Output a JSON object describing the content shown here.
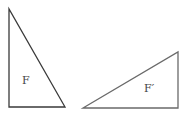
{
  "diagram": {
    "stroke_color": "#3a3a3a",
    "figures": [
      {
        "id": "F",
        "label": "F",
        "points": "9,9 9,107 65,107",
        "label_x": 22,
        "label_y": 84
      },
      {
        "id": "F-prime",
        "label": "F′",
        "points": "83,108 178,52 178,108",
        "label_x": 144,
        "label_y": 92
      }
    ]
  }
}
